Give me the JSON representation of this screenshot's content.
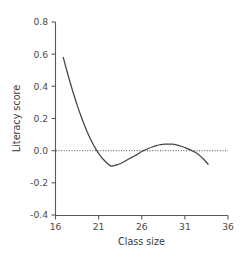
{
  "chart_data": {
    "type": "line",
    "title": "",
    "xlabel": "Class size",
    "ylabel": "Literacy score",
    "xlim": [
      16,
      36
    ],
    "ylim": [
      -0.4,
      0.8
    ],
    "xticks": [
      16,
      21,
      26,
      31,
      36
    ],
    "xtick_labels": [
      "16",
      "21",
      "26",
      "31",
      "36"
    ],
    "yticks": [
      -0.4,
      -0.2,
      0.0,
      0.2,
      0.4,
      0.6,
      0.8
    ],
    "ytick_labels": [
      "-0.4",
      "-0.2",
      "0.0",
      "0.2",
      "0.4",
      "0.6",
      "0.8"
    ],
    "grid": false,
    "legend": null,
    "annotations": [
      {
        "name": "zero-reference-line",
        "type": "hline",
        "y": 0.0,
        "style": "dotted"
      }
    ],
    "series": [
      {
        "name": "Literacy score vs class size",
        "color": "#444444",
        "x": [
          16.9,
          17.3,
          17.7,
          18.1,
          18.5,
          18.9,
          19.3,
          19.7,
          19.9,
          20.3,
          20.7,
          21.1,
          21.5,
          21.9,
          22.4,
          22.9,
          23.4,
          23.9,
          24.4,
          24.9,
          25.4,
          25.9,
          26.2,
          26.7,
          27.2,
          27.7,
          28.2,
          28.7,
          29.2,
          29.5,
          30.0,
          30.5,
          31.0,
          31.5,
          32.0,
          32.3,
          32.8,
          33.2,
          33.7
        ],
        "y": [
          0.58,
          0.5,
          0.424,
          0.352,
          0.285,
          0.223,
          0.166,
          0.114,
          0.09,
          0.046,
          0.008,
          -0.025,
          -0.052,
          -0.073,
          -0.095,
          -0.092,
          -0.083,
          -0.07,
          -0.055,
          -0.04,
          -0.026,
          -0.008,
          0.0,
          0.012,
          0.023,
          0.031,
          0.037,
          0.04,
          0.041,
          0.04,
          0.036,
          0.029,
          0.019,
          0.008,
          -0.005,
          -0.013,
          -0.034,
          -0.055,
          -0.085
        ]
      }
    ]
  },
  "axis": {
    "y_title": "Literacy score",
    "x_title": "Class size"
  }
}
